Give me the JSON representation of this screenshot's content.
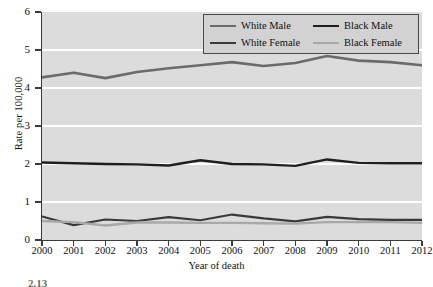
{
  "chart_data": {
    "type": "line",
    "title": "",
    "xlabel": "Year of death",
    "ylabel": "Rate per 100,000",
    "categories": [
      "2000",
      "2001",
      "2002",
      "2003",
      "2004",
      "2005",
      "2006",
      "2007",
      "2008",
      "2009",
      "2010",
      "2011",
      "2012"
    ],
    "x": [
      2000,
      2001,
      2002,
      2003,
      2004,
      2005,
      2006,
      2007,
      2008,
      2009,
      2010,
      2011,
      2012
    ],
    "xlim": [
      2000,
      2012
    ],
    "ylim": [
      0,
      6
    ],
    "yticks": [
      0,
      1,
      2,
      3,
      4,
      5,
      6
    ],
    "ytick_labels": [
      "0",
      "1",
      "2",
      "3",
      "4",
      "5",
      "6"
    ],
    "grid": "horizontal-white",
    "legend_position": "top-right",
    "series": [
      {
        "name": "White Male",
        "color": "#6b6b6b",
        "width": 2.6,
        "values": [
          4.28,
          4.4,
          4.26,
          4.42,
          4.52,
          4.6,
          4.68,
          4.58,
          4.66,
          4.84,
          4.72,
          4.68,
          4.6
        ]
      },
      {
        "name": "Black Male",
        "color": "#1f1f1f",
        "width": 2.4,
        "values": [
          2.04,
          2.02,
          2.0,
          1.99,
          1.96,
          2.1,
          2.0,
          1.99,
          1.95,
          2.12,
          2.03,
          2.02,
          2.02
        ]
      },
      {
        "name": "White Female",
        "color": "#3a3a3a",
        "width": 2.2,
        "values": [
          0.62,
          0.39,
          0.54,
          0.5,
          0.6,
          0.52,
          0.67,
          0.57,
          0.49,
          0.61,
          0.55,
          0.53,
          0.53
        ]
      },
      {
        "name": "Black Female",
        "color": "#a8a8a8",
        "width": 2.4,
        "values": [
          0.5,
          0.47,
          0.38,
          0.46,
          0.46,
          0.45,
          0.45,
          0.44,
          0.43,
          0.47,
          0.47,
          0.47,
          0.45
        ]
      }
    ]
  },
  "legend": {
    "entries": [
      {
        "label": "White Male"
      },
      {
        "label": "Black Male"
      },
      {
        "label": "White Female"
      },
      {
        "label": "Black Female"
      }
    ]
  },
  "caption": {
    "text": "2.13"
  },
  "colors": {
    "plot_background": "#dcdcdc",
    "gridline": "#ffffff",
    "axis": "#3b3b3b",
    "legend_background": "#d2d2d2",
    "legend_border": "#4a4a4a"
  }
}
